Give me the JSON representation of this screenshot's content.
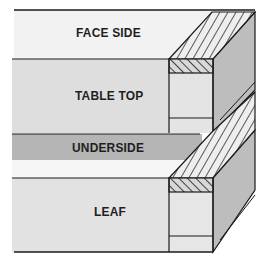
{
  "diagram": {
    "labels": {
      "face_side": "FACE SIDE",
      "table_top": "TABLE TOP",
      "underside": "UNDERSIDE",
      "leaf": "LEAF"
    },
    "colors": {
      "face_side": "#f2f2f2",
      "table_top": "#dedede",
      "underside": "#b5b5b5",
      "white_strip": "#f6f6f6",
      "leaf": "#e2e2e2",
      "end_face": "#bdbdbd",
      "line": "#1a1a1a"
    }
  }
}
